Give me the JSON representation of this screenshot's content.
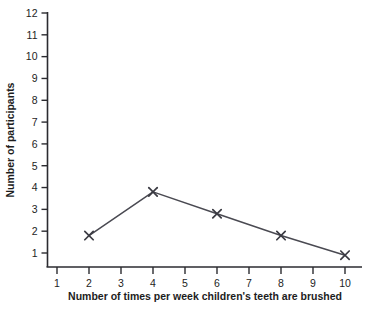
{
  "chart_data": {
    "type": "line",
    "title": "",
    "subtitle": "",
    "xlabel": "Number of times per week children's teeth are brushed",
    "ylabel": "Number of participants",
    "x": [
      2,
      4,
      6,
      8,
      10
    ],
    "values": [
      1.8,
      3.8,
      2.8,
      1.8,
      0.9
    ],
    "series": [
      {
        "name": "Number of participants",
        "x": [
          2,
          4,
          6,
          8,
          10
        ],
        "values": [
          1.8,
          3.8,
          2.8,
          1.8,
          0.9
        ]
      }
    ],
    "xlim": [
      1,
      10
    ],
    "ylim": [
      1,
      12
    ],
    "xticks": [
      1,
      2,
      3,
      4,
      5,
      6,
      7,
      8,
      9,
      10
    ],
    "yticks": [
      1,
      2,
      3,
      4,
      5,
      6,
      7,
      8,
      9,
      10,
      11,
      12
    ],
    "xtick_labels": [
      "1",
      "2",
      "3",
      "4",
      "5",
      "6",
      "7",
      "8",
      "9",
      "10"
    ],
    "ytick_labels": [
      "1",
      "2",
      "3",
      "4",
      "5",
      "6",
      "7",
      "8",
      "9",
      "10",
      "11",
      "12"
    ],
    "grid": false,
    "legend": false,
    "legend_position": "none",
    "marker": "x-marker",
    "line_color": "#4a4a52",
    "marker_color": "#3a3a42",
    "axis_color": "#2b2b30",
    "background_color": "#ffffff",
    "annotations": []
  }
}
